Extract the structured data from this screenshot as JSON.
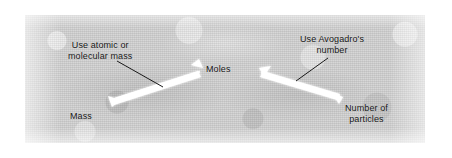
{
  "figure": {
    "panel": {
      "background_color": "#cfcfcf",
      "border_color": "#ffffff"
    }
  },
  "labels": {
    "left_annotation": {
      "line1": "Use atomic or",
      "line2": "molecular mass"
    },
    "center_node": "Moles",
    "right_annotation": {
      "line1": "Use Avogadro's",
      "line2": "number"
    },
    "left_node": "Mass",
    "right_node": {
      "line1": "Number of",
      "line2": "particles"
    }
  },
  "arrows": {
    "left_arrow": {
      "name": "mass-to-moles-arrow",
      "from": "Mass",
      "to": "Moles",
      "color": "#ffffff",
      "style": "double-headed"
    },
    "right_arrow": {
      "name": "moles-to-particles-arrow",
      "from": "Moles",
      "to": "Number of particles",
      "color": "#ffffff",
      "style": "double-headed"
    }
  },
  "leader_lines": {
    "left_leader_color": "#1a1a1a",
    "right_leader_color": "#1a1a1a"
  }
}
